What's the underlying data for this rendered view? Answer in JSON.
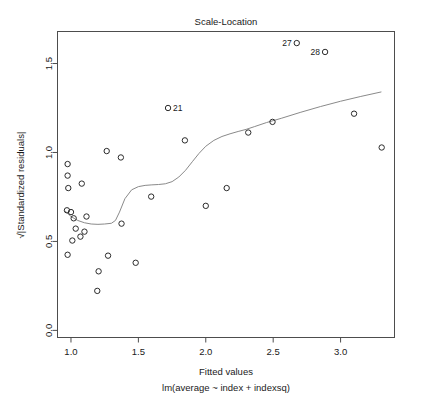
{
  "chart_data": {
    "type": "scatter",
    "title": "Scale-Location",
    "xlabel": "Fitted values",
    "sublabel": "lm(average ~ index + indexsq)",
    "ylabel": "√|Standardized residuals|",
    "xlim": [
      0.9,
      3.4
    ],
    "ylim": [
      -0.04,
      1.68
    ],
    "xticks": [
      1.0,
      1.5,
      2.0,
      2.5,
      3.0
    ],
    "xticklabels": [
      "1.0",
      "1.5",
      "2.0",
      "2.5",
      "3.0"
    ],
    "yticks": [
      0.0,
      0.5,
      1.0,
      1.5
    ],
    "yticklabels": [
      "0.0",
      "0.5",
      "1.0",
      "1.5"
    ],
    "grid": false,
    "legend": null,
    "marker": "open-circle",
    "points": [
      {
        "x": 0.975,
        "y": 0.935
      },
      {
        "x": 0.975,
        "y": 0.87
      },
      {
        "x": 0.98,
        "y": 0.8
      },
      {
        "x": 1.08,
        "y": 0.825
      },
      {
        "x": 0.97,
        "y": 0.675
      },
      {
        "x": 1.0,
        "y": 0.665
      },
      {
        "x": 1.02,
        "y": 0.63
      },
      {
        "x": 1.115,
        "y": 0.64
      },
      {
        "x": 1.035,
        "y": 0.572
      },
      {
        "x": 1.1,
        "y": 0.555
      },
      {
        "x": 1.07,
        "y": 0.527
      },
      {
        "x": 1.01,
        "y": 0.505
      },
      {
        "x": 0.975,
        "y": 0.425
      },
      {
        "x": 1.205,
        "y": 0.332
      },
      {
        "x": 1.195,
        "y": 0.222
      },
      {
        "x": 1.275,
        "y": 0.42
      },
      {
        "x": 1.265,
        "y": 1.008
      },
      {
        "x": 1.37,
        "y": 0.972
      },
      {
        "x": 1.375,
        "y": 0.6
      },
      {
        "x": 1.48,
        "y": 0.38
      },
      {
        "x": 1.595,
        "y": 0.752
      },
      {
        "x": 1.72,
        "y": 1.25,
        "label": "21"
      },
      {
        "x": 1.845,
        "y": 1.068
      },
      {
        "x": 2.0,
        "y": 0.7
      },
      {
        "x": 2.155,
        "y": 0.8
      },
      {
        "x": 2.315,
        "y": 1.112
      },
      {
        "x": 2.495,
        "y": 1.172
      },
      {
        "x": 2.675,
        "y": 1.615,
        "label": "27"
      },
      {
        "x": 2.885,
        "y": 1.565,
        "label": "28"
      },
      {
        "x": 3.1,
        "y": 1.218
      },
      {
        "x": 3.305,
        "y": 1.028
      }
    ],
    "smooth_curve": {
      "name": "lowess",
      "x": [
        0.955,
        1.0,
        1.05,
        1.1,
        1.15,
        1.2,
        1.25,
        1.3,
        1.33,
        1.36,
        1.4,
        1.45,
        1.5,
        1.55,
        1.6,
        1.65,
        1.7,
        1.75,
        1.8,
        1.85,
        1.9,
        1.95,
        2.0,
        2.06,
        2.12,
        2.18,
        2.24,
        2.3,
        2.36,
        2.45,
        2.56,
        2.7,
        2.85,
        3.0,
        3.15,
        3.3
      ],
      "y": [
        0.672,
        0.64,
        0.618,
        0.605,
        0.598,
        0.596,
        0.598,
        0.602,
        0.618,
        0.665,
        0.74,
        0.79,
        0.808,
        0.815,
        0.818,
        0.82,
        0.824,
        0.836,
        0.862,
        0.9,
        0.948,
        0.995,
        1.035,
        1.068,
        1.09,
        1.105,
        1.118,
        1.13,
        1.145,
        1.168,
        1.192,
        1.225,
        1.258,
        1.288,
        1.315,
        1.34
      ]
    }
  }
}
